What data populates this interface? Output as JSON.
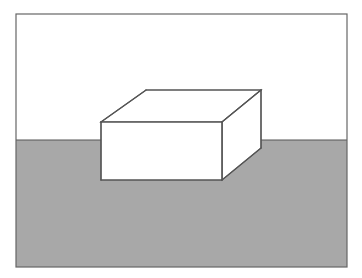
{
  "figure": {
    "title": "Cuboid resting on a ground plane with horizon",
    "kind": "line-drawing",
    "canvas": {
      "width": 362,
      "height": 278,
      "background": "#ffffff"
    },
    "colors": {
      "background_sky": "#ffffff",
      "ground_fill": "#a8a8a8",
      "object_fill": "#ffffff",
      "stroke": "#555555",
      "frame_stroke": "#666666"
    },
    "frame": {
      "label": "picture-frame",
      "x": 16,
      "y": 14,
      "width": 331,
      "height": 253,
      "stroke_width": 1.2
    },
    "horizon": {
      "label": "horizon-line",
      "y": 140,
      "x_start": 16,
      "x_end": 347,
      "stroke_width": 1.2
    },
    "regions": [
      {
        "name": "sky-region",
        "label": "Sky / upper white field",
        "fill": "#ffffff",
        "y_top": 14,
        "y_bottom": 140
      },
      {
        "name": "ground-region",
        "label": "Ground / lower gray field",
        "fill": "#a8a8a8",
        "y_top": 140,
        "y_bottom": 267
      }
    ],
    "box": {
      "label": "cuboid",
      "projection": "oblique",
      "stroke_width": 1.2,
      "vertices": {
        "front_top_left": [
          101,
          122
        ],
        "front_top_right": [
          222,
          122
        ],
        "front_bottom_right": [
          222,
          180
        ],
        "front_bottom_left": [
          101,
          180
        ],
        "back_top_left": [
          146,
          90
        ],
        "back_top_right": [
          261,
          90
        ],
        "back_bottom_right": [
          261,
          148
        ]
      },
      "faces": [
        {
          "name": "top-face",
          "label": "Top face",
          "points": "101,122 146,90 261,90 222,122",
          "fill": "#ffffff"
        },
        {
          "name": "right-face",
          "label": "Right side face",
          "points": "222,122 261,90 261,148 222,180",
          "fill": "#ffffff"
        },
        {
          "name": "front-face",
          "label": "Front face",
          "points": "101,122 222,122 222,180 101,180",
          "fill": "#ffffff"
        }
      ],
      "edges": [
        {
          "name": "edge-front-top",
          "from": [
            101,
            122
          ],
          "to": [
            222,
            122
          ]
        },
        {
          "name": "edge-front-right",
          "from": [
            222,
            122
          ],
          "to": [
            222,
            180
          ]
        },
        {
          "name": "edge-front-bottom",
          "from": [
            222,
            180
          ],
          "to": [
            101,
            180
          ]
        },
        {
          "name": "edge-front-left",
          "from": [
            101,
            180
          ],
          "to": [
            101,
            122
          ]
        },
        {
          "name": "edge-top-left-receding",
          "from": [
            101,
            122
          ],
          "to": [
            146,
            90
          ]
        },
        {
          "name": "edge-top-back",
          "from": [
            146,
            90
          ],
          "to": [
            261,
            90
          ]
        },
        {
          "name": "edge-top-right-receding",
          "from": [
            261,
            90
          ],
          "to": [
            222,
            122
          ]
        },
        {
          "name": "edge-back-right-vertical",
          "from": [
            261,
            90
          ],
          "to": [
            261,
            148
          ]
        },
        {
          "name": "edge-bottom-right-receding",
          "from": [
            261,
            148
          ],
          "to": [
            222,
            180
          ]
        }
      ]
    }
  }
}
